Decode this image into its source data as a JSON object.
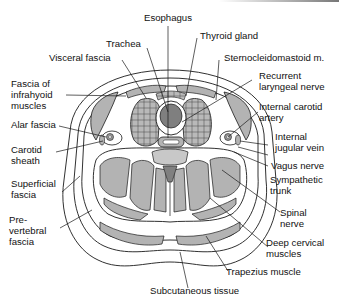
{
  "diagram": {
    "colors": {
      "line": "#1a1a1a",
      "muscle_fill": "#b3b3b3",
      "dark_fill": "#808080",
      "background": "#ffffff",
      "fascia_fill": "#ffffff"
    },
    "labels": {
      "esophagus": "Esophagus",
      "trachea": "Trachea",
      "thyroid_gland": "Thyroid gland",
      "visceral_fascia": "Visceral fascia",
      "sternocleidomastoid": "Sternocleidomastoid m.",
      "fascia_infrahyoid": "Fascia of\ninfrahyoid\nmuscles",
      "recurrent_laryngeal": "Recurrent\nlaryngeal nerve",
      "internal_carotid": "Internal carotid\nartery",
      "alar_fascia": "Alar fascia",
      "internal_jugular": "Internal\njugular vein",
      "carotid_sheath": "Carotid\nsheath",
      "vagus_nerve": "Vagus nerve",
      "sympathetic_trunk": "Sympathetic\ntrunk",
      "superficial_fascia": "Superficial\nfascia",
      "spinal_nerve": "Spinal\nnerve",
      "prevertebral_fascia": "Pre-\nvertebral\nfascia",
      "deep_cervical_muscles": "Deep cervical\nmuscles",
      "trapezius": "Trapezius muscle",
      "subcutaneous": "Subcutaneous tissue"
    }
  }
}
